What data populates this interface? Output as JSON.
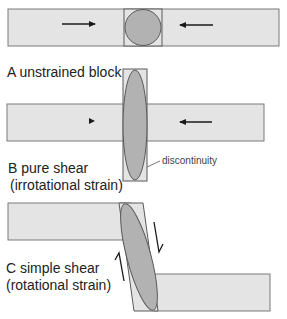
{
  "panels": {
    "a": {
      "caption": "A unstrained block",
      "arrows": [
        "push-right",
        "push-left"
      ]
    },
    "b": {
      "caption_line1": "B pure shear",
      "caption_line2": "(irrotational strain)",
      "annotation": "discontinuity"
    },
    "c": {
      "caption_line1": "C simple shear",
      "caption_line2": "(rotational strain)",
      "shear_arrows": [
        "shear-down",
        "shear-up"
      ]
    }
  },
  "colors": {
    "block_fill": "#e4e4e4",
    "block_stroke": "#7a7a7a",
    "strain_marker_fill": "#b2b2b2",
    "strain_marker_stroke": "#5a5a5a",
    "arrow": "#1a1a1a"
  }
}
